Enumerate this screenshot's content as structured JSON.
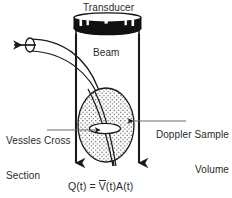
{
  "figure": {
    "background_color": "#ffffff",
    "ink_color": "#1a1a1a",
    "labels": {
      "transducer": "Transducer",
      "beam": "Beam",
      "vessel_cross_section_line1": "Vessles Cross",
      "vessel_cross_section_line2": "Section",
      "doppler_sample_volume_line1": "Doppler Sample",
      "doppler_sample_volume_line2": "Volume"
    },
    "equation": {
      "left": "Q(t) = ",
      "v_symbol": "V",
      "v_arg": "(t)",
      "area": "A(t)",
      "full_text": "Q(t) = V̄(t)A(t)"
    },
    "parts": {
      "transducer_head": "transducer-crystal-head",
      "transducer_body": "transducer-housing",
      "beam_left_edge": "beam-left-edge-arrow",
      "beam_right_edge": "beam-right-edge-arrow",
      "vessel_tube": "blood-vessel-tube",
      "vessel_end_ellipse": "vessel-open-end",
      "flow_arrow": "blood-flow-direction-arrow",
      "sample_volume": "doppler-sample-volume-ellipse",
      "vessel_cross_section_ellipse": "vessel-cross-section-ellipse",
      "leader_left": "vessel-cross-section-leader",
      "leader_right": "doppler-sample-volume-leader"
    },
    "colors": {
      "stipple": "#3a3a3a",
      "head_fill": "#111111",
      "line": "#1a1a1a"
    }
  }
}
